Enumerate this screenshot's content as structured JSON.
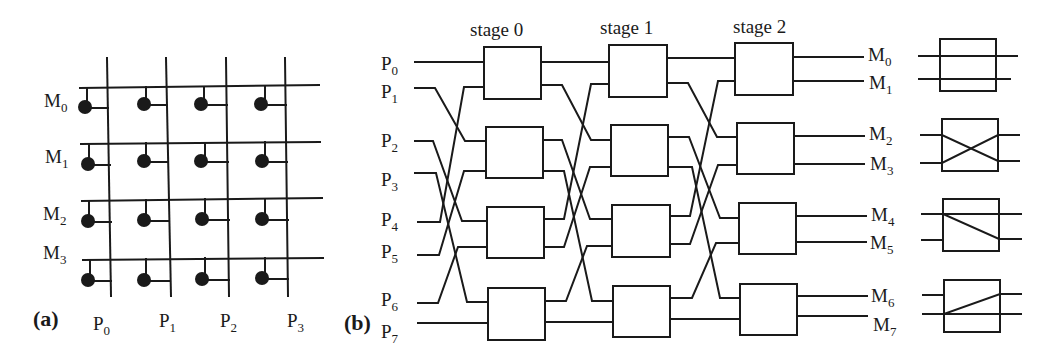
{
  "figure": {
    "panel_a": {
      "label": "(a)",
      "title": "crossbar switch",
      "memory_labels": [
        {
          "base": "M",
          "sub": "0"
        },
        {
          "base": "M",
          "sub": "1"
        },
        {
          "base": "M",
          "sub": "2"
        },
        {
          "base": "M",
          "sub": "3"
        }
      ],
      "processor_labels": [
        {
          "base": "P",
          "sub": "0"
        },
        {
          "base": "P",
          "sub": "1"
        },
        {
          "base": "P",
          "sub": "2"
        },
        {
          "base": "P",
          "sub": "3"
        }
      ]
    },
    "panel_b": {
      "label": "(b)",
      "title": "multistage omega network",
      "stages": [
        "stage 0",
        "stage 1",
        "stage 2"
      ],
      "inputs": [
        {
          "base": "P",
          "sub": "0"
        },
        {
          "base": "P",
          "sub": "1"
        },
        {
          "base": "P",
          "sub": "2"
        },
        {
          "base": "P",
          "sub": "3"
        },
        {
          "base": "P",
          "sub": "4"
        },
        {
          "base": "P",
          "sub": "5"
        },
        {
          "base": "P",
          "sub": "6"
        },
        {
          "base": "P",
          "sub": "7"
        }
      ],
      "outputs": [
        {
          "base": "M",
          "sub": "0"
        },
        {
          "base": "M",
          "sub": "1"
        },
        {
          "base": "M",
          "sub": "2"
        },
        {
          "base": "M",
          "sub": "3"
        },
        {
          "base": "M",
          "sub": "4"
        },
        {
          "base": "M",
          "sub": "5"
        },
        {
          "base": "M",
          "sub": "6"
        },
        {
          "base": "M",
          "sub": "7"
        }
      ],
      "switch_states": [
        "straight",
        "crossed",
        "upper broadcast",
        "lower broadcast"
      ]
    }
  }
}
